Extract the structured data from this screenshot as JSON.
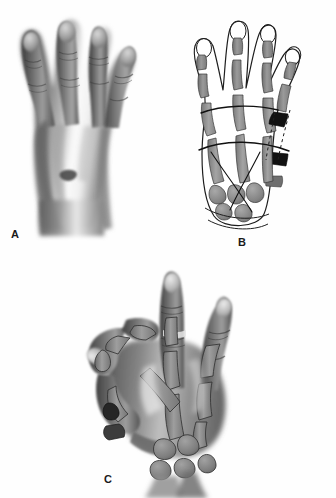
{
  "figure": {
    "type": "medical-illustration",
    "layout": "three-panel",
    "background_color": "#fefefe",
    "ink_color": "#1a1a1a",
    "dimensions": {
      "width": 336,
      "height": 498
    }
  },
  "panels": [
    {
      "id": "A",
      "label": "A",
      "name": "panel-a-dorsal-hand-photograph",
      "description": "Grayscale wash rendering of the dorsum of a hand with four fingers extended",
      "style": "tonal-wash",
      "label_position": {
        "x": 11,
        "y": 229
      }
    },
    {
      "id": "B",
      "label": "B",
      "name": "panel-b-skeletal-line-diagram",
      "description": "Line drawing of the same hand with underlying skeleton, transverse arc lines and darkened bone segments along the fifth ray",
      "style": "line-drawing",
      "label_position": {
        "x": 238,
        "y": 237
      }
    },
    {
      "id": "C",
      "label": "C",
      "name": "panel-c-pinch-posture-skeleton",
      "description": "Hand in thumb-to-index pinch posture with skeletal overlay and two dark graft blocks at the ulnar carpus",
      "style": "tonal-wash-with-skeleton",
      "label_position": {
        "x": 104,
        "y": 474
      }
    }
  ],
  "markings": {
    "darkened_bone_segments": [
      {
        "panel": "B",
        "site": "fifth-proximal-phalanx",
        "color": "#111111"
      },
      {
        "panel": "B",
        "site": "fifth-metacarpal-shaft",
        "color": "#111111"
      },
      {
        "panel": "B",
        "site": "ulnar-carpal-block",
        "color": "#111111"
      },
      {
        "panel": "C",
        "site": "ulnar-carpus-upper-block",
        "color": "#2b2b2b"
      },
      {
        "panel": "C",
        "site": "ulnar-carpus-lower-block",
        "color": "#3a3a3a"
      }
    ],
    "arc_lines": [
      {
        "panel": "B",
        "name": "distal-transverse-arch"
      },
      {
        "panel": "B",
        "name": "proximal-transverse-arch"
      },
      {
        "panel": "B",
        "name": "oblique-axis-lines"
      }
    ],
    "dashed_lines": [
      {
        "panel": "B",
        "name": "fifth-ray-resection-axis"
      }
    ]
  },
  "palette": {
    "bone_gray": "#8e8e8e",
    "bone_gray_dark": "#6f6f6f",
    "bone_gray_light": "#a8a8a8",
    "skin_wash_dark": "#5d5d5d",
    "skin_wash_mid": "#8a8a8a",
    "skin_wash_light": "#c9c9c9",
    "highlight": "#f2f2f2",
    "outline": "#1e1e1e",
    "black_segment": "#111111"
  },
  "signature": {
    "text": "",
    "panel": "C"
  }
}
